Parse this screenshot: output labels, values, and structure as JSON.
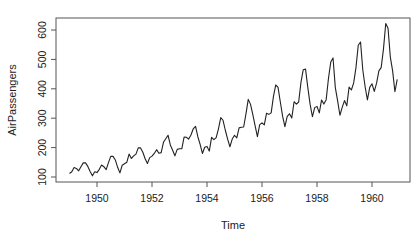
{
  "chart_data": {
    "type": "line",
    "title": "",
    "xlabel": "Time",
    "ylabel": "AirPassengers",
    "xlim": [
      1949,
      1960.9167
    ],
    "ylim": [
      104,
      622
    ],
    "x_ticks": [
      1950,
      1952,
      1954,
      1956,
      1958,
      1960
    ],
    "y_ticks": [
      100,
      200,
      300,
      400,
      500,
      600
    ],
    "grid": false,
    "legend": null,
    "series": [
      {
        "name": "AirPassengers",
        "start": 1949,
        "frequency": 12,
        "values": [
          112,
          118,
          132,
          129,
          121,
          135,
          148,
          148,
          136,
          119,
          104,
          118,
          115,
          126,
          141,
          135,
          125,
          149,
          170,
          170,
          158,
          133,
          114,
          140,
          145,
          150,
          178,
          163,
          172,
          178,
          199,
          199,
          184,
          162,
          146,
          166,
          171,
          180,
          193,
          181,
          183,
          218,
          230,
          242,
          209,
          191,
          172,
          194,
          196,
          196,
          236,
          235,
          229,
          243,
          264,
          272,
          237,
          211,
          180,
          201,
          204,
          188,
          235,
          227,
          234,
          264,
          302,
          293,
          259,
          229,
          203,
          229,
          242,
          233,
          267,
          269,
          270,
          315,
          364,
          347,
          312,
          274,
          237,
          278,
          284,
          277,
          317,
          313,
          318,
          374,
          413,
          405,
          355,
          306,
          271,
          306,
          315,
          301,
          356,
          348,
          355,
          422,
          465,
          467,
          404,
          347,
          305,
          336,
          340,
          318,
          362,
          348,
          363,
          435,
          491,
          505,
          404,
          359,
          310,
          337,
          360,
          342,
          406,
          396,
          420,
          472,
          548,
          559,
          463,
          407,
          362,
          405,
          417,
          391,
          419,
          461,
          472,
          535,
          622,
          606,
          508,
          461,
          390,
          432
        ]
      }
    ]
  },
  "colors": {
    "line": "#222222",
    "axis": "#444444",
    "text": "#222222"
  }
}
